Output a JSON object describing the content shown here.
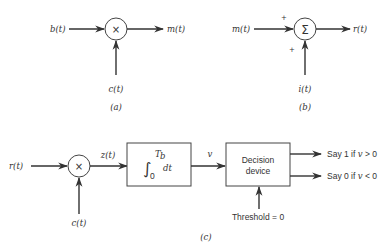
{
  "diagram_a": {
    "caption": "(a)",
    "input_left": "b(t)",
    "input_bottom": "c(t)",
    "output": "m(t)",
    "operator": "×"
  },
  "diagram_b": {
    "caption": "(b)",
    "input_left": "m(t)",
    "input_bottom": "i(t)",
    "output": "r(t)",
    "operator": "Σ",
    "sign_left": "+",
    "sign_bottom": "+"
  },
  "diagram_c": {
    "caption": "(c)",
    "input_left": "r(t)",
    "input_bottom": "c(t)",
    "multiplier_operator": "×",
    "multiplier_output": "z(t)",
    "integrator": {
      "lower_limit": "0",
      "upper_limit": "T",
      "upper_limit_sub": "b",
      "differential": "dt"
    },
    "integrator_output": "v",
    "decision_device": {
      "line1": "Decision",
      "line2": "device"
    },
    "threshold": "Threshold = 0",
    "outputs": [
      {
        "label": "Say 1 if ",
        "var": "v",
        "cond": " > 0"
      },
      {
        "label": "Say 0 if ",
        "var": "v",
        "cond": " < 0"
      }
    ]
  }
}
